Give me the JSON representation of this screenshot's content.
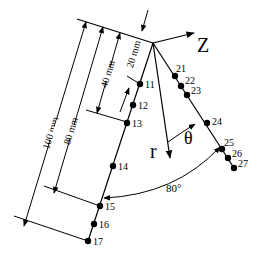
{
  "diagram": {
    "type": "probe-layout-schematic",
    "colors": {
      "stroke": "#000000",
      "background": "#ffffff"
    },
    "axes": {
      "z_label": "Z",
      "r_label": "r",
      "theta_label": "θ"
    },
    "angle": {
      "label": "80°"
    },
    "dimensions": [
      {
        "label": "100 mm"
      },
      {
        "label": "80 mm"
      },
      {
        "label": "40 mm"
      },
      {
        "label": "20 mm"
      }
    ],
    "probe_line_1": {
      "points": [
        {
          "label": "11"
        },
        {
          "label": "12"
        },
        {
          "label": "13"
        },
        {
          "label": "14"
        },
        {
          "label": "15"
        },
        {
          "label": "16"
        },
        {
          "label": "17"
        }
      ]
    },
    "probe_line_2": {
      "points": [
        {
          "label": "21"
        },
        {
          "label": "22"
        },
        {
          "label": "23"
        },
        {
          "label": "24"
        },
        {
          "label": "25"
        },
        {
          "label": "26"
        },
        {
          "label": "27"
        }
      ]
    }
  }
}
